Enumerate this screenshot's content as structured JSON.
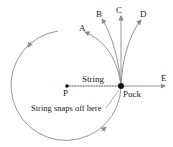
{
  "labels": {
    "A": "A",
    "B": "B",
    "C": "C",
    "D": "D",
    "E": "E",
    "P": "P",
    "string": "String",
    "puck": "Puck",
    "snap": "String snaps off here"
  },
  "colors": {
    "line": "#8a8a8a",
    "point": "#111111",
    "text": "#222222"
  }
}
